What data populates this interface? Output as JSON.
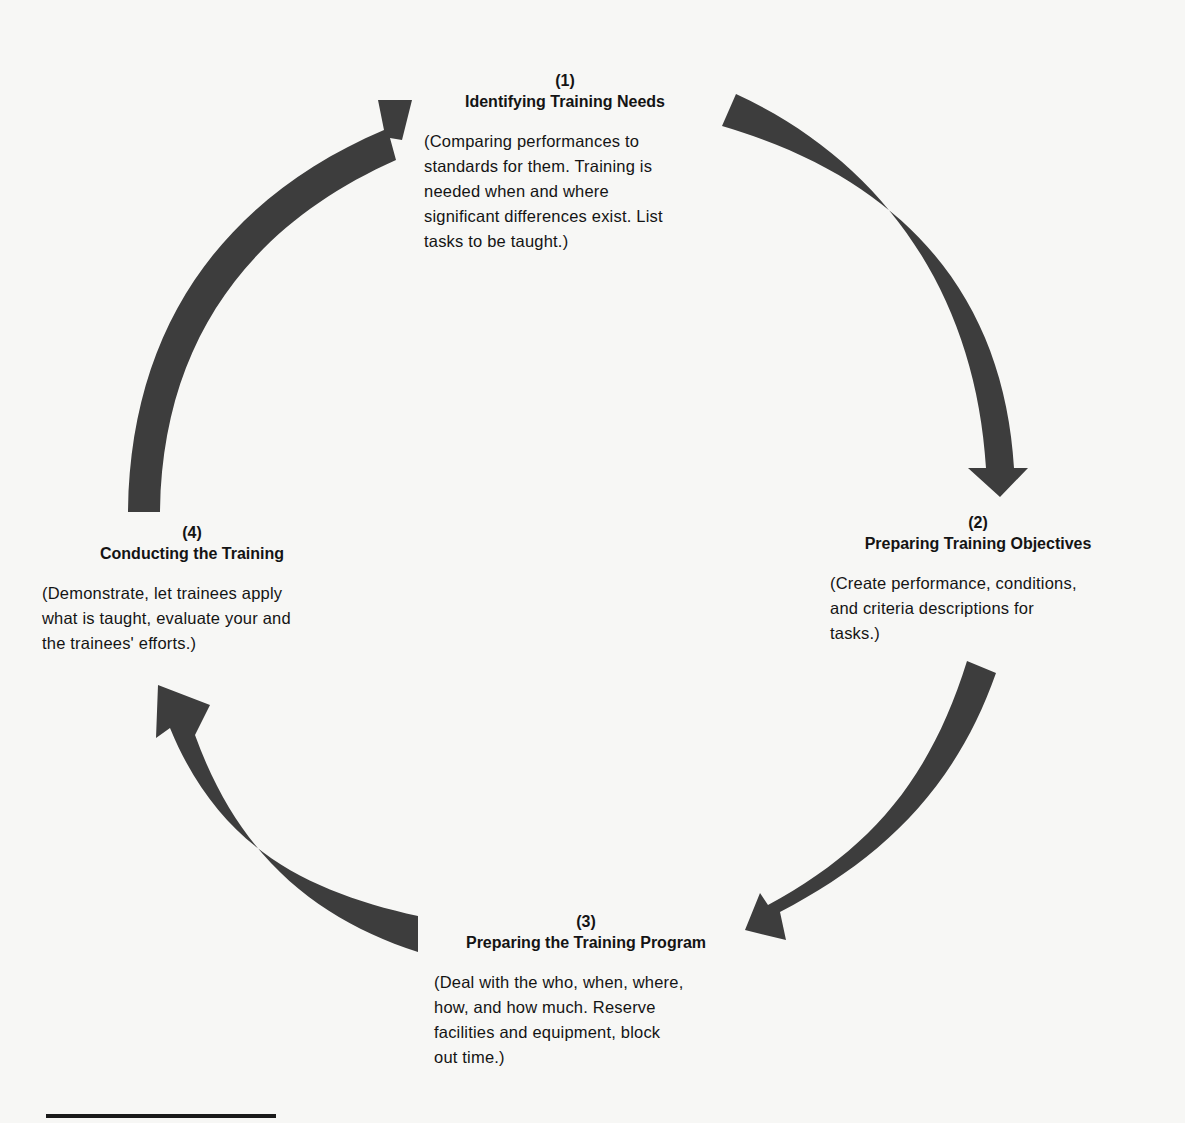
{
  "diagram": {
    "type": "cycle",
    "arrow_color": "#3d3d3d",
    "steps": [
      {
        "number": "(1)",
        "title": "Identifying Training Needs",
        "description": "(Comparing performances to\nstandards for them. Training is\nneeded when and where\nsignificant differences exist. List\ntasks to be taught.)"
      },
      {
        "number": "(2)",
        "title": "Preparing Training Objectives",
        "description": "(Create performance, conditions,\nand criteria descriptions for\ntasks.)"
      },
      {
        "number": "(3)",
        "title": "Preparing the Training Program",
        "description": "(Deal with the who, when, where,\nhow, and how much. Reserve\nfacilities and equipment, block\nout time.)"
      },
      {
        "number": "(4)",
        "title": "Conducting the Training",
        "description": "(Demonstrate, let trainees apply\nwhat is taught, evaluate your and\nthe trainees' efforts.)"
      }
    ],
    "flow": [
      {
        "from": "(4)",
        "to": "(1)"
      },
      {
        "from": "(1)",
        "to": "(2)"
      },
      {
        "from": "(2)",
        "to": "(3)"
      },
      {
        "from": "(3)",
        "to": "(4)"
      }
    ]
  }
}
